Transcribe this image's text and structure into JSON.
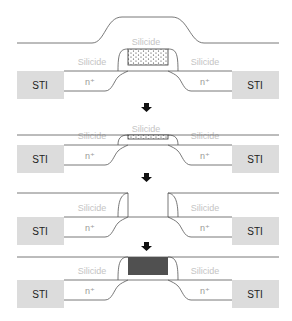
{
  "labels": {
    "sti": "STI",
    "silicide": "Silicide",
    "n_plus": "n⁺"
  },
  "colors": {
    "sti_fill": "#dcdcdc",
    "silicide_text": "#c4c4c4",
    "metal_gate_fill": "#505050",
    "dummy_gate_dots": "#333333"
  },
  "steps": [
    {
      "id": "step-1",
      "description": "Dielectric deposition over dummy poly gate"
    },
    {
      "id": "step-2",
      "description": "Planarization (CMP)"
    },
    {
      "id": "step-3",
      "description": "Dummy gate removal"
    },
    {
      "id": "step-4",
      "description": "Metal gate fill"
    }
  ],
  "arrow_icon": "down-arrow-icon"
}
